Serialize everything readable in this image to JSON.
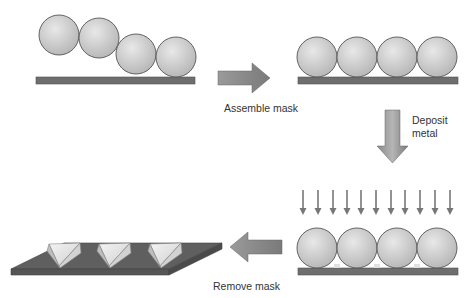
{
  "steps": [
    {
      "id": "step1",
      "description": "Spheres randomly placed on substrate"
    },
    {
      "id": "step2",
      "description": "Close-packed sphere monolayer mask"
    },
    {
      "id": "step3",
      "description": "Metal deposition through mask"
    },
    {
      "id": "step4",
      "description": "Triangular metal nanoparticles on substrate"
    }
  ],
  "labels": {
    "assemble": "Assemble mask",
    "deposit_line1": "Deposit",
    "deposit_line2": "metal",
    "remove": "Remove mask"
  },
  "deposition_arrow_count": 11,
  "colors": {
    "sphere_light": "#e4e4e4",
    "sphere_dark": "#b8b8b8",
    "sphere_stroke": "#555555",
    "substrate": "#6e6e6e",
    "arrow_light": "#b0b0b0",
    "arrow_dark": "#7a7a7a",
    "text": "#333333"
  }
}
